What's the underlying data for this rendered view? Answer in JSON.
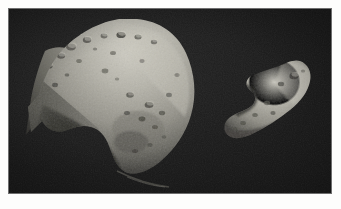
{
  "page": {
    "background_color": "#fdfdfc",
    "margin_px": 9
  },
  "photo": {
    "alt_title": "Two asteroids imaged by spacecraft",
    "sky_color": "#1b1b1b",
    "border_color": "#6e6e6e",
    "width": 322,
    "height": 184,
    "type": "grayscale-photograph"
  },
  "objects": [
    {
      "id": "asteroid-large",
      "label": "Mathilde",
      "position": "left",
      "description": "Large irregular cratered asteroid with a long tapering shadowed limb on the lower left and a bright sunlit upper-right flank",
      "surface_bright_color": "#b9b7ad",
      "surface_mid_color": "#8d8b83",
      "surface_shadow_color": "#4a4944",
      "crater_count_visible": 27
    },
    {
      "id": "asteroid-small",
      "label": "Eros",
      "position": "right",
      "description": "Elongated peanut-shaped asteroid tilted up to the right with a saddle notch on its upper-left side",
      "surface_bright_color": "#b4b2a8",
      "surface_mid_color": "#8a887f",
      "surface_shadow_color": "#474641",
      "crater_count_visible": 9
    }
  ],
  "features": {
    "faint_streak": {
      "id": "lower-tail-streak",
      "description": "Faint thin bright streak trailing from the lower edge of the large asteroid toward the lower left"
    }
  }
}
